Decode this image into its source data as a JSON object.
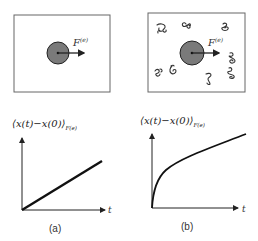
{
  "panels": [
    {
      "id": "a",
      "caption": "(a)",
      "box_label_force": "F",
      "box_label_sup": "(e)",
      "y_label_main": "⟨x(t)−x(0)⟩",
      "y_label_sub": "F(e)",
      "x_label": "t",
      "curve": "linear",
      "obstacles": 0
    },
    {
      "id": "b",
      "caption": "(b)",
      "box_label_force": "F",
      "box_label_sup": "(e)",
      "y_label_main": "⟨x(t)−x(0)⟩",
      "y_label_sub": "F(e)",
      "x_label": "t",
      "curve": "sublinear-then-linear",
      "obstacles": 9
    }
  ],
  "colors": {
    "particle_fill": "#7a7a7a",
    "stroke": "#222222",
    "box_stroke": "#555555"
  }
}
